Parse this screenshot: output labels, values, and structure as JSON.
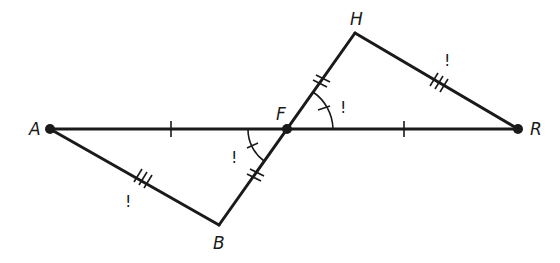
{
  "diagram": {
    "type": "geometry",
    "points": {
      "A": {
        "label": "A",
        "x": 50,
        "y": 129
      },
      "F": {
        "label": "F",
        "x": 287,
        "y": 129
      },
      "R": {
        "label": "R",
        "x": 518,
        "y": 129
      },
      "H": {
        "label": "H",
        "x": 355,
        "y": 33
      },
      "B": {
        "label": "B",
        "x": 219,
        "y": 225
      }
    },
    "segments": [
      {
        "from": "A",
        "to": "R",
        "marks": "A-F and F-R single tick"
      },
      {
        "from": "A",
        "to": "B",
        "marks": "triple tick"
      },
      {
        "from": "B",
        "to": "H",
        "marks": "B-F and F-H double tick"
      },
      {
        "from": "H",
        "to": "R",
        "marks": "triple tick"
      }
    ],
    "angle_marks": [
      {
        "vertex": "F",
        "between": [
          "A",
          "B"
        ],
        "style": "single arc, single tick"
      },
      {
        "vertex": "F",
        "between": [
          "R",
          "H"
        ],
        "style": "single arc, single tick"
      }
    ],
    "annotations": {
      "bang": "!"
    },
    "colors": {
      "stroke": "#1a1a1a",
      "background": "#ffffff"
    }
  }
}
